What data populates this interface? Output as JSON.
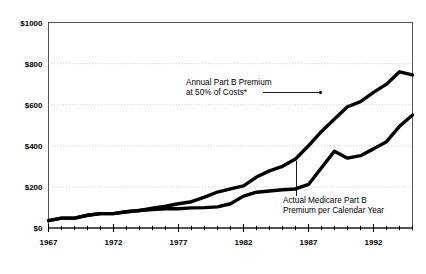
{
  "chart_data": {
    "type": "line",
    "title": "",
    "subtitle": "",
    "xlabel": "",
    "ylabel": "",
    "xlim": [
      1967,
      1995
    ],
    "ylim": [
      0,
      1000
    ],
    "grid": true,
    "grid_axis": "y",
    "legend_position": "none",
    "y_tick_labels": [
      "$1000",
      "$800",
      "$600",
      "$400",
      "$200",
      "$0"
    ],
    "y_tick_values": [
      1000,
      800,
      600,
      400,
      200,
      0
    ],
    "x_tick_labels": [
      "1967",
      "1972",
      "1977",
      "1982",
      "1987",
      "1992"
    ],
    "x_tick_values": [
      1967,
      1972,
      1977,
      1982,
      1987,
      1992
    ],
    "x_minor_tick_step": 1,
    "x": [
      1967,
      1968,
      1969,
      1970,
      1971,
      1972,
      1973,
      1974,
      1975,
      1976,
      1977,
      1978,
      1979,
      1980,
      1981,
      1982,
      1983,
      1984,
      1985,
      1986,
      1987,
      1988,
      1989,
      1990,
      1991,
      1992,
      1993,
      1994,
      1995
    ],
    "series": [
      {
        "name": "Annual Part B Premium at 50% of Costs*",
        "values": [
          36,
          48,
          48,
          62,
          70,
          70,
          79,
          85,
          96,
          106,
          118,
          128,
          150,
          175,
          190,
          205,
          248,
          278,
          300,
          336,
          400,
          470,
          530,
          590,
          615,
          660,
          700,
          760,
          745
        ]
      },
      {
        "name": "Actual Medicare Part B Premium per Calendar Year",
        "values": [
          36,
          48,
          48,
          62,
          70,
          70,
          79,
          85,
          90,
          94,
          94,
          98,
          99,
          103,
          118,
          155,
          174,
          180,
          186,
          190,
          212,
          293,
          374,
          340,
          352,
          385,
          420,
          495,
          550
        ]
      }
    ],
    "annotations": [
      {
        "id": "upper-annotation",
        "line1": "Annual Part B Premium",
        "line2": "at 50% of Costs*",
        "leader": "horizontal-right-with-dot"
      },
      {
        "id": "lower-annotation",
        "line1": "Actual Medicare Part B",
        "line2": "Premium per Calendar Year",
        "leader": "vertical-up"
      }
    ],
    "colors": {
      "series_line": "#000000",
      "gridline": "#b9b9b9",
      "frame": "#555555",
      "axis": "#000000",
      "background": "#ffffff"
    }
  }
}
